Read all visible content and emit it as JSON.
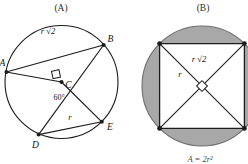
{
  "figure": {
    "caption_formula": "A = 2r²",
    "colors": {
      "stroke": "#1b1b1b",
      "shade": "#a8a8a8",
      "background": "#ffffff",
      "text": "#111111"
    },
    "panels": [
      {
        "id": "panel-a",
        "title": "(A)",
        "shape": "circle-with-inscribed-chords",
        "point_labels": [
          "A",
          "B",
          "C",
          "D",
          "E"
        ],
        "measure_labels": [
          "r √2",
          "r"
        ],
        "angle_labels": [
          "60°"
        ],
        "right_angle_marker": true
      },
      {
        "id": "panel-b",
        "title": "(B)",
        "shape": "circle-with-inscribed-square-shaded-segments",
        "point_labels": [],
        "measure_labels": [
          "r √2",
          "r"
        ],
        "angle_labels": [],
        "right_angle_marker": true
      }
    ]
  }
}
